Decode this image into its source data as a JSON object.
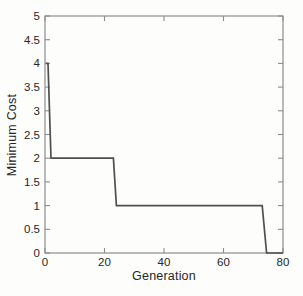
{
  "figure": {
    "background_color": "#fdfdfc",
    "axis_color": "#8d8d8d",
    "text_color": "#262626"
  },
  "chart_data": {
    "type": "line",
    "subtype": "step",
    "title": "",
    "xlabel": "Generation",
    "ylabel": "Minimum Cost",
    "xlim": [
      0,
      80
    ],
    "ylim": [
      0,
      5
    ],
    "xticks": {
      "values": [
        0,
        20,
        40,
        60,
        80
      ],
      "labels": [
        "0",
        "20",
        "40",
        "60",
        "80"
      ]
    },
    "yticks": {
      "values": [
        0,
        0.5,
        1,
        1.5,
        2,
        2.5,
        3,
        3.5,
        4,
        4.5,
        5
      ],
      "labels": [
        "0",
        "0.5",
        "1",
        "1.5",
        "2",
        "2.5",
        "3",
        "3.5",
        "4",
        "4.5",
        "5"
      ]
    },
    "grid": false,
    "legend": null,
    "box": true,
    "ticks_inward": true,
    "line_color": "#4f4f4f",
    "line_width": 1.7,
    "series": [
      {
        "name": "minimum-cost",
        "points": [
          [
            0.3,
            4
          ],
          [
            1,
            4
          ],
          [
            2,
            2
          ],
          [
            23,
            2
          ],
          [
            24,
            1
          ],
          [
            73,
            1
          ],
          [
            74.5,
            0
          ],
          [
            80,
            0
          ]
        ]
      }
    ]
  }
}
